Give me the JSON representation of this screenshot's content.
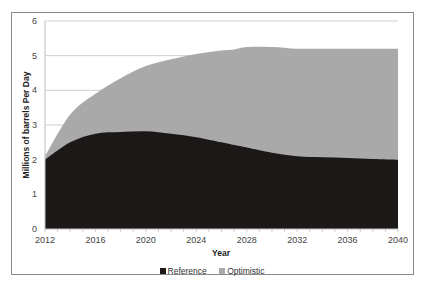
{
  "chart_data": {
    "type": "area",
    "stacking": "overlapping",
    "title": "",
    "xlabel": "Year",
    "ylabel": "Millions of barrels Per Day",
    "x": [
      2012,
      2014,
      2016,
      2018,
      2020,
      2022,
      2024,
      2026,
      2027,
      2028,
      2030,
      2032,
      2034,
      2036,
      2038,
      2040
    ],
    "series": [
      {
        "name": "Reference",
        "color": "#1c1818",
        "values": [
          2.0,
          2.5,
          2.75,
          2.8,
          2.82,
          2.75,
          2.65,
          2.5,
          2.42,
          2.35,
          2.2,
          2.1,
          2.07,
          2.05,
          2.02,
          2.0
        ]
      },
      {
        "name": "Optimistic",
        "color": "#a9a9a9",
        "values": [
          2.1,
          3.3,
          3.9,
          4.35,
          4.7,
          4.9,
          5.05,
          5.15,
          5.18,
          5.25,
          5.25,
          5.2,
          5.2,
          5.2,
          5.2,
          5.2
        ]
      }
    ],
    "xticks": [
      "2012",
      "2016",
      "2020",
      "2024",
      "2028",
      "2032",
      "2036",
      "2040"
    ],
    "yticks": [
      "0",
      "1",
      "2",
      "3",
      "4",
      "5",
      "6"
    ],
    "ylim": [
      0,
      6
    ],
    "xlim": [
      2012,
      2040
    ],
    "grid": "horizontal",
    "legend_position": "bottom"
  },
  "legend": {
    "items": [
      {
        "label": "Reference",
        "color": "#1c1818"
      },
      {
        "label": "Optimistic",
        "color": "#a9a9a9"
      }
    ]
  }
}
